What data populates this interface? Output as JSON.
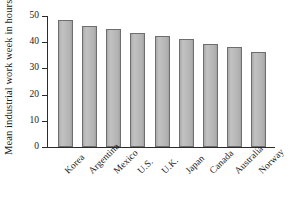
{
  "chart_data": {
    "type": "bar",
    "title": "",
    "xlabel": "",
    "ylabel": "Mean industrial work week in hours",
    "categories": [
      "Korea",
      "Argentina",
      "Mexico",
      "U.S.",
      "U.K.",
      "Japan",
      "Canada",
      "Australia",
      "Norway"
    ],
    "values": [
      48.5,
      46.2,
      45.0,
      43.6,
      42.4,
      41.2,
      39.3,
      38.2,
      36.4
    ],
    "ylim": [
      0,
      50
    ],
    "yticks": [
      0,
      10,
      20,
      30,
      40,
      50
    ],
    "ytick_labels": [
      "0",
      "10",
      "20",
      "30",
      "40",
      "50"
    ],
    "grid": false,
    "legend": false,
    "legend_position": "none",
    "bar_fill_color": "#b4b4b4",
    "bar_edge_color": "#6e6e6e",
    "axis_color": "#2b2b2b",
    "background_color": "#ffffff",
    "xtick_label_rotation": -45
  }
}
